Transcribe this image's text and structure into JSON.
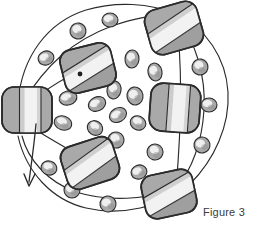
{
  "figure": {
    "caption": "Figure 3",
    "background_color": "#ffffff",
    "stroke_color": "#2b2b2b",
    "body_fill": "#a9a9a9",
    "body_shade": "#8c8c8c",
    "highlight_fill": "#f2f2f2",
    "midtone_fill": "#c6c6c6",
    "title": "",
    "alt": "Hand-drawn spherical structure with rounded-cube subunits on the surface, small oval particles inside, connecting curved lines and a downward arrow"
  },
  "chart_data": {
    "type": "diagram",
    "title": "Figure 3",
    "xlabel": "",
    "ylabel": "",
    "outer_curves": [
      {
        "name": "outer-ring-upper-left",
        "path": "M 18 102 C 22 56 48 22 86 10 C 116 1 150 3 176 14"
      },
      {
        "name": "outer-ring-right",
        "path": "M 176 14 C 206 28 226 58 228 92 C 230 126 214 160 190 184"
      },
      {
        "name": "outer-ring-lower",
        "path": "M 190 184 C 162 208 120 216 86 208 C 52 200 26 172 18 136"
      },
      {
        "name": "inner-chord-left-top",
        "path": "M 22 104 C 46 64 74 40 112 26 C 142 16 164 14 176 16"
      },
      {
        "name": "inner-chord-top-right",
        "path": "M 176 16 C 196 42 206 76 204 110 C 202 142 192 170 176 188"
      },
      {
        "name": "inner-chord-bottom-left",
        "path": "M 176 188 C 146 200 108 202 76 192 C 48 182 28 160 22 136"
      },
      {
        "name": "radial-link-left-to-topnode",
        "path": "M 24 106 C 48 88 66 76 86 68"
      },
      {
        "name": "radial-link-left-to-bottomnode",
        "path": "M 26 124 C 52 140 72 152 92 162"
      },
      {
        "name": "radial-link-topnode-to-center",
        "path": "M 80 74 L 100 84"
      },
      {
        "name": "radial-link-right",
        "path": "M 176 16 C 182 60 182 120 176 188"
      }
    ],
    "arrow": {
      "name": "down-arrow",
      "path": "M 36 124 C 34 146 31 166 29 182",
      "head": "M 24 174 L 29 186 L 35 174"
    },
    "large_subunits": [
      {
        "id": "top",
        "cx": 174,
        "cy": 28,
        "rx": 27,
        "ry": 23,
        "rot": -16,
        "band": "diagonal"
      },
      {
        "id": "upper-left",
        "cx": 88,
        "cy": 68,
        "rx": 26,
        "ry": 22,
        "rot": -14,
        "band": "diagonal"
      },
      {
        "id": "left",
        "cx": 27,
        "cy": 110,
        "rx": 25,
        "ry": 23,
        "rot": 0,
        "band": "vertical"
      },
      {
        "id": "right",
        "cx": 175,
        "cy": 108,
        "rx": 25,
        "ry": 24,
        "rot": 4,
        "band": "vertical"
      },
      {
        "id": "lower-left",
        "cx": 90,
        "cy": 163,
        "rx": 27,
        "ry": 22,
        "rot": -18,
        "band": "diagonal"
      },
      {
        "id": "bottom",
        "cx": 169,
        "cy": 194,
        "rx": 26,
        "ry": 22,
        "rot": -12,
        "band": "diagonal"
      }
    ],
    "perimeter_beads": [
      {
        "cx": 46,
        "cy": 58,
        "rx": 8,
        "ry": 7,
        "rot": -20
      },
      {
        "cx": 78,
        "cy": 31,
        "rx": 8,
        "ry": 8,
        "rot": 10
      },
      {
        "cx": 110,
        "cy": 20,
        "rx": 8,
        "ry": 7,
        "rot": 0
      },
      {
        "cx": 200,
        "cy": 67,
        "rx": 8,
        "ry": 8,
        "rot": 10
      },
      {
        "cx": 209,
        "cy": 105,
        "rx": 8,
        "ry": 7,
        "rot": 0
      },
      {
        "cx": 202,
        "cy": 145,
        "rx": 8,
        "ry": 8,
        "rot": -10
      },
      {
        "cx": 49,
        "cy": 168,
        "rx": 8,
        "ry": 7,
        "rot": 15
      },
      {
        "cx": 72,
        "cy": 190,
        "rx": 8,
        "ry": 8,
        "rot": 0
      },
      {
        "cx": 108,
        "cy": 204,
        "rx": 8,
        "ry": 8,
        "rot": -8
      }
    ],
    "interior_particles": [
      {
        "cx": 68,
        "cy": 98,
        "rx": 9,
        "ry": 7,
        "rot": -15
      },
      {
        "cx": 63,
        "cy": 123,
        "rx": 9,
        "ry": 7,
        "rot": 20
      },
      {
        "cx": 97,
        "cy": 104,
        "rx": 9,
        "ry": 7,
        "rot": -25
      },
      {
        "cx": 95,
        "cy": 128,
        "rx": 8,
        "ry": 7,
        "rot": 35
      },
      {
        "cx": 114,
        "cy": 90,
        "rx": 7,
        "ry": 9,
        "rot": 10
      },
      {
        "cx": 118,
        "cy": 115,
        "rx": 9,
        "ry": 7,
        "rot": -30
      },
      {
        "cx": 116,
        "cy": 140,
        "rx": 8,
        "ry": 8,
        "rot": 15
      },
      {
        "cx": 135,
        "cy": 96,
        "rx": 8,
        "ry": 9,
        "rot": -10
      },
      {
        "cx": 138,
        "cy": 123,
        "rx": 8,
        "ry": 7,
        "rot": 25
      },
      {
        "cx": 132,
        "cy": 59,
        "rx": 7,
        "ry": 9,
        "rot": 5
      },
      {
        "cx": 155,
        "cy": 72,
        "rx": 7,
        "ry": 9,
        "rot": -12
      },
      {
        "cx": 155,
        "cy": 152,
        "rx": 8,
        "ry": 8,
        "rot": 20
      },
      {
        "cx": 139,
        "cy": 172,
        "rx": 8,
        "ry": 7,
        "rot": -20
      },
      {
        "cx": 90,
        "cy": 83,
        "rx": 7,
        "ry": 6,
        "rot": 0
      }
    ]
  }
}
